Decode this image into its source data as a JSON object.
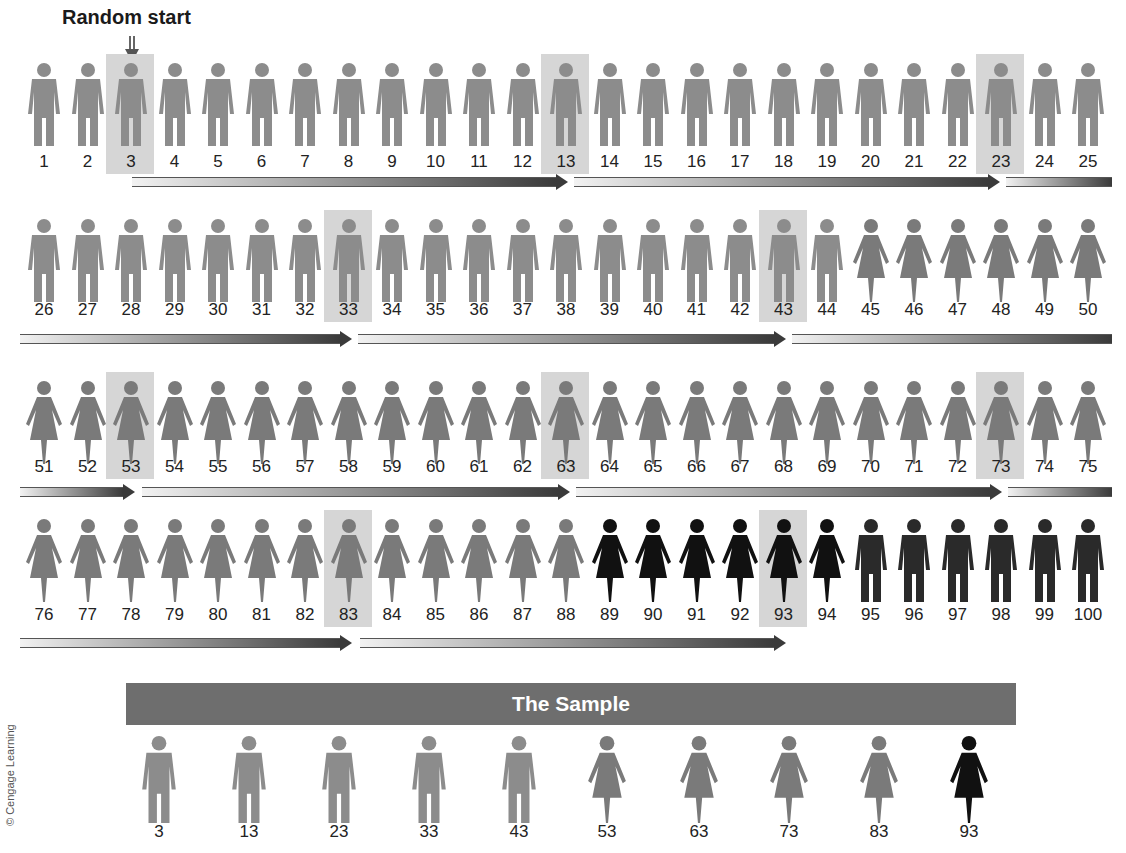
{
  "title": "Random start",
  "population": {
    "count": 100,
    "rows": [
      {
        "numbers": [
          1,
          2,
          3,
          4,
          5,
          6,
          7,
          8,
          9,
          10,
          11,
          12,
          13,
          14,
          15,
          16,
          17,
          18,
          19,
          20,
          21,
          22,
          23,
          24,
          25
        ]
      },
      {
        "numbers": [
          26,
          27,
          28,
          29,
          30,
          31,
          32,
          33,
          34,
          35,
          36,
          37,
          38,
          39,
          40,
          41,
          42,
          43,
          44,
          45,
          46,
          47,
          48,
          49,
          50
        ]
      },
      {
        "numbers": [
          51,
          52,
          53,
          54,
          55,
          56,
          57,
          58,
          59,
          60,
          61,
          62,
          63,
          64,
          65,
          66,
          67,
          68,
          69,
          70,
          71,
          72,
          73,
          74,
          75
        ]
      },
      {
        "numbers": [
          76,
          77,
          78,
          79,
          80,
          81,
          82,
          83,
          84,
          85,
          86,
          87,
          88,
          89,
          90,
          91,
          92,
          93,
          94,
          95,
          96,
          97,
          98,
          99,
          100
        ]
      }
    ],
    "groups": [
      {
        "range": [
          1,
          44
        ],
        "type": "male",
        "color": "#8c8c8c"
      },
      {
        "range": [
          45,
          88
        ],
        "type": "female",
        "color": "#7a7a7a"
      },
      {
        "range": [
          89,
          94
        ],
        "type": "female",
        "color": "#111111"
      },
      {
        "range": [
          95,
          100
        ],
        "type": "male",
        "color": "#2a2a2a"
      }
    ],
    "selected": [
      3,
      13,
      23,
      33,
      43,
      53,
      63,
      73,
      83,
      93
    ],
    "sampling_interval": 10
  },
  "sample": {
    "label": "The Sample",
    "members": [
      {
        "number": "3",
        "type": "male",
        "color": "#8c8c8c"
      },
      {
        "number": "13",
        "type": "male",
        "color": "#8c8c8c"
      },
      {
        "number": "23",
        "type": "male",
        "color": "#8c8c8c"
      },
      {
        "number": "33",
        "type": "male",
        "color": "#8c8c8c"
      },
      {
        "number": "43",
        "type": "male",
        "color": "#8c8c8c"
      },
      {
        "number": "53",
        "type": "female",
        "color": "#7a7a7a"
      },
      {
        "number": "63",
        "type": "female",
        "color": "#7a7a7a"
      },
      {
        "number": "73",
        "type": "female",
        "color": "#7a7a7a"
      },
      {
        "number": "83",
        "type": "female",
        "color": "#7a7a7a"
      },
      {
        "number": "93",
        "type": "female",
        "color": "#111111"
      }
    ]
  },
  "copyright": "© Cengage Learning",
  "colors": {
    "highlight": "#d6d6d6",
    "bar": "#6e6e6e",
    "arrow_dark": "#3a3a3a",
    "arrow_light": "#f0f0f0"
  }
}
